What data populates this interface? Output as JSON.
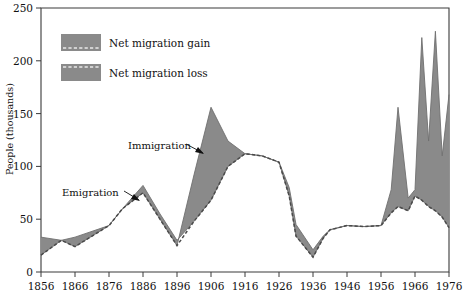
{
  "chart_data": {
    "type": "area",
    "title": "",
    "subtitle": "",
    "xlabel": "",
    "ylabel": "People (thousands)",
    "xlim": [
      1856,
      1976
    ],
    "ylim": [
      0,
      250
    ],
    "grid": false,
    "legend_position": "upper-left-inside",
    "x_ticks": [
      1856,
      1866,
      1876,
      1886,
      1896,
      1906,
      1916,
      1926,
      1936,
      1946,
      1956,
      1966,
      1976
    ],
    "y_ticks": [
      0,
      50,
      100,
      150,
      200,
      250
    ],
    "legend": [
      {
        "label": "Net migration gain",
        "swatch": "#8a8a8a",
        "pattern": "dashed-top"
      },
      {
        "label": "Net migration loss",
        "swatch": "#8a8a8a",
        "pattern": "dashed-top"
      }
    ],
    "annotations": [
      {
        "label": "Immigration",
        "x": 1897,
        "y": 122
      },
      {
        "label": "Emigration",
        "x": 1869,
        "y": 65
      }
    ],
    "series": [
      {
        "name": "Immigration",
        "x": [
          1856,
          1862,
          1866,
          1876,
          1880,
          1886,
          1891,
          1896,
          1901,
          1906,
          1911,
          1916,
          1921,
          1926,
          1929,
          1931,
          1936,
          1939,
          1941,
          1946,
          1951,
          1956,
          1959,
          1961,
          1964,
          1966,
          1968,
          1970,
          1972,
          1974,
          1976
        ],
        "values": [
          16,
          30,
          33,
          44,
          60,
          75,
          50,
          25,
          92,
          156,
          124,
          112,
          110,
          104,
          72,
          34,
          14,
          32,
          40,
          44,
          43,
          44,
          78,
          156,
          70,
          78,
          222,
          124,
          228,
          110,
          168
        ]
      },
      {
        "name": "Emigration",
        "x": [
          1856,
          1862,
          1866,
          1876,
          1880,
          1886,
          1891,
          1896,
          1901,
          1906,
          1911,
          1916,
          1921,
          1926,
          1929,
          1931,
          1936,
          1939,
          1941,
          1946,
          1951,
          1956,
          1959,
          1961,
          1964,
          1966,
          1968,
          1970,
          1972,
          1974,
          1976
        ],
        "values": [
          33,
          30,
          24,
          44,
          60,
          82,
          55,
          30,
          48,
          68,
          100,
          112,
          110,
          104,
          80,
          45,
          21,
          34,
          40,
          44,
          43,
          44,
          56,
          62,
          58,
          72,
          68,
          62,
          58,
          52,
          42
        ]
      }
    ]
  },
  "axis": {
    "y_title": "People (thousands)"
  }
}
